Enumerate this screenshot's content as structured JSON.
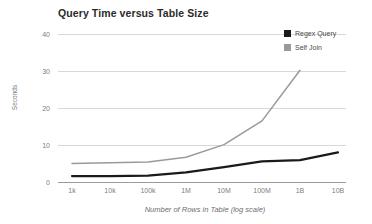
{
  "chart_data": {
    "type": "line",
    "title": "Query Time versus Table Size",
    "xlabel": "Number of Rows in Table (log scale)",
    "ylabel": "Seconds",
    "categories": [
      "1k",
      "10k",
      "100k",
      "1M",
      "10M",
      "100M",
      "1B",
      "10B"
    ],
    "x_tick_labels": [
      "1k",
      "10k",
      "100k",
      "1M",
      "10M",
      "100M",
      "1B",
      "10B"
    ],
    "y_tick_labels": [
      "0",
      "10",
      "20",
      "30",
      "40"
    ],
    "y_ticks": [
      0,
      10,
      20,
      30,
      40
    ],
    "ylim": [
      0,
      40
    ],
    "grid": "horizontal",
    "legend_position": "top-right",
    "series": [
      {
        "name": "Regex Query",
        "color": "#1a1a1a",
        "values": [
          1.6,
          1.6,
          1.7,
          2.6,
          4.0,
          5.6,
          5.9,
          8.0
        ]
      },
      {
        "name": "Self Join",
        "color": "#9a9a9a",
        "values": [
          5.0,
          5.2,
          5.4,
          6.7,
          10.1,
          16.5,
          30.2,
          null
        ]
      }
    ]
  },
  "legend": {
    "items": [
      {
        "label": "Regex Query",
        "color": "#1a1a1a"
      },
      {
        "label": "Self Join",
        "color": "#9a9a9a"
      }
    ]
  },
  "axes": {
    "grid_color": "#d8d8d8",
    "axis_color": "#9a9a9a"
  }
}
